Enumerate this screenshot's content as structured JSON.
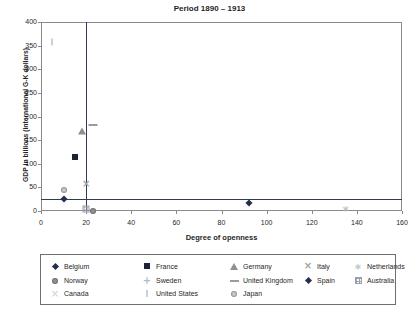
{
  "title": "Period 1890 – 1913",
  "chart_data": {
    "type": "scatter",
    "title": "Period 1890 – 1913",
    "xlabel": "Degree of openness",
    "ylabel": "GDP in billions (international G-K dollars)",
    "xlim": [
      0,
      160
    ],
    "ylim": [
      0,
      400
    ],
    "x_ticks": [
      0,
      20,
      40,
      60,
      80,
      100,
      120,
      140,
      160
    ],
    "y_ticks": [
      0,
      50,
      100,
      150,
      200,
      250,
      300,
      350,
      400
    ],
    "grid": false,
    "legend_position": "bottom",
    "ref_lines": [
      {
        "axis": "x",
        "value": 20,
        "color": "#303c55"
      },
      {
        "axis": "y",
        "value": 25,
        "color": "#303c55"
      }
    ],
    "series": [
      {
        "name": "Belgium",
        "marker": "diamond",
        "color": "#232f4e",
        "points": [
          [
            92,
            17
          ]
        ]
      },
      {
        "name": "France",
        "marker": "square",
        "color": "#1c2335",
        "points": [
          [
            15,
            114
          ]
        ]
      },
      {
        "name": "Germany",
        "marker": "triangle",
        "color": "#8f8f8f",
        "points": [
          [
            18,
            170
          ]
        ]
      },
      {
        "name": "Italy",
        "marker": "x",
        "color": "#a3a3a3",
        "points": [
          [
            20,
            58
          ]
        ]
      },
      {
        "name": "Netherlands",
        "marker": "asterisk",
        "color": "#c4c4c4",
        "points": [
          [
            135,
            7
          ]
        ]
      },
      {
        "name": "Norway",
        "marker": "circle",
        "color": "#8f8f8f",
        "points": [
          [
            23,
            1
          ]
        ]
      },
      {
        "name": "Sweden",
        "marker": "plus",
        "color": "#b3bcc9",
        "points": []
      },
      {
        "name": "United Kingdom",
        "marker": "dash",
        "color": "#9b9b9b",
        "points": [
          [
            23,
            183
          ]
        ]
      },
      {
        "name": "Spain",
        "marker": "diamond",
        "color": "#232f4e",
        "points": [
          [
            10,
            25
          ]
        ]
      },
      {
        "name": "Australia",
        "marker": "grid-square",
        "color": "#98a0ad",
        "points": [
          [
            20,
            5
          ]
        ]
      },
      {
        "name": "Canada",
        "marker": "x",
        "color": "#d8d8d8",
        "points": []
      },
      {
        "name": "United States",
        "marker": "vbar",
        "color": "#ccd1d9",
        "points": [
          [
            5,
            358
          ]
        ]
      },
      {
        "name": "Japan",
        "marker": "circle",
        "color": "#c6c6c6",
        "points": [
          [
            10,
            44
          ]
        ]
      }
    ]
  }
}
